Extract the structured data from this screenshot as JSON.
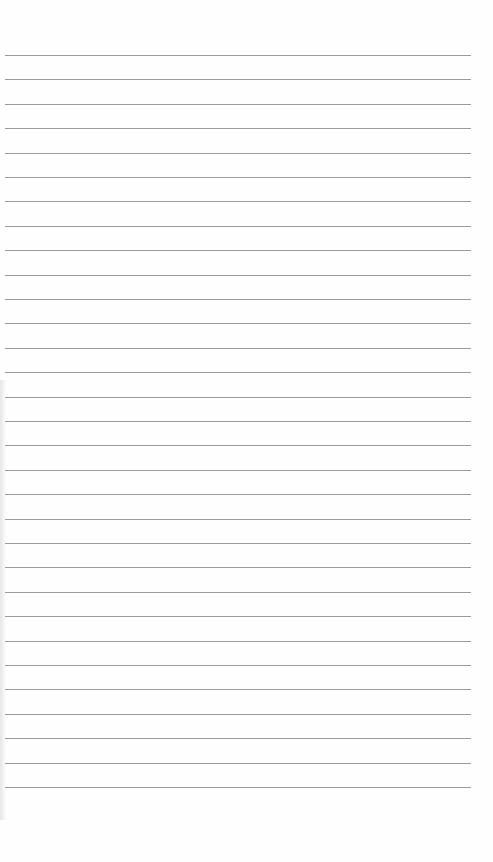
{
  "page": {
    "type": "lined-notebook-paper",
    "line_count": 31,
    "first_line_y": 55,
    "line_spacing": 24.4,
    "line_color": "#8a8a8a",
    "background_color": "#fefefe"
  }
}
